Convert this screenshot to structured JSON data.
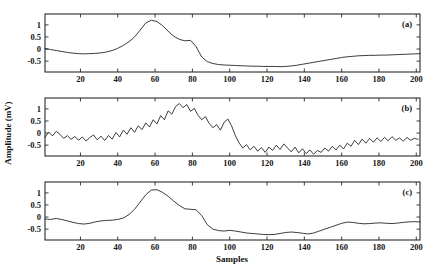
{
  "chart_data": {
    "type": "line",
    "title": "",
    "xlabel": "Samples",
    "ylabel": "Amplitude (mV)",
    "xlim": [
      1,
      202
    ],
    "ylim": [
      -0.95,
      1.45
    ],
    "xticks": [
      20,
      40,
      60,
      80,
      100,
      120,
      140,
      160,
      180,
      200
    ],
    "yticks": [
      1,
      0.5,
      0,
      -0.5
    ],
    "ytick_labels": [
      "1",
      "0.5",
      "0",
      "-0.5"
    ],
    "grid": false,
    "legend": "none",
    "panels": [
      {
        "label": "(a)",
        "name": "clean-signal",
        "x": [
          1,
          4,
          7,
          10,
          13,
          16,
          19,
          22,
          25,
          28,
          31,
          34,
          37,
          40,
          43,
          46,
          49,
          52,
          55,
          58,
          61,
          64,
          67,
          70,
          73,
          76,
          79,
          82,
          85,
          88,
          91,
          94,
          97,
          100,
          103,
          106,
          109,
          112,
          115,
          118,
          121,
          124,
          127,
          130,
          133,
          136,
          139,
          142,
          145,
          148,
          151,
          154,
          157,
          160,
          163,
          166,
          169,
          172,
          175,
          178,
          181,
          184,
          187,
          190,
          193,
          196,
          199,
          202
        ],
        "y": [
          0.02,
          -0.02,
          -0.06,
          -0.1,
          -0.14,
          -0.17,
          -0.19,
          -0.2,
          -0.19,
          -0.18,
          -0.16,
          -0.12,
          -0.06,
          0.03,
          0.15,
          0.3,
          0.5,
          0.78,
          1.08,
          1.19,
          1.14,
          0.97,
          0.74,
          0.53,
          0.4,
          0.34,
          0.36,
          0.1,
          -0.33,
          -0.52,
          -0.6,
          -0.64,
          -0.66,
          -0.67,
          -0.68,
          -0.69,
          -0.7,
          -0.71,
          -0.71,
          -0.72,
          -0.72,
          -0.72,
          -0.73,
          -0.72,
          -0.7,
          -0.67,
          -0.63,
          -0.59,
          -0.55,
          -0.51,
          -0.47,
          -0.43,
          -0.39,
          -0.35,
          -0.32,
          -0.3,
          -0.28,
          -0.27,
          -0.26,
          -0.26,
          -0.25,
          -0.25,
          -0.24,
          -0.23,
          -0.22,
          -0.21,
          -0.2,
          -0.19
        ]
      },
      {
        "label": "(b)",
        "name": "noisy-signal",
        "x": [
          1,
          3,
          5,
          7,
          9,
          11,
          13,
          15,
          17,
          19,
          21,
          23,
          25,
          27,
          29,
          31,
          33,
          35,
          37,
          39,
          41,
          43,
          45,
          47,
          49,
          51,
          53,
          55,
          57,
          59,
          61,
          63,
          65,
          67,
          69,
          71,
          73,
          75,
          77,
          79,
          81,
          83,
          85,
          87,
          89,
          91,
          93,
          95,
          97,
          99,
          101,
          103,
          105,
          107,
          109,
          111,
          113,
          115,
          117,
          119,
          121,
          123,
          125,
          127,
          129,
          131,
          133,
          135,
          137,
          139,
          141,
          143,
          145,
          147,
          149,
          151,
          153,
          155,
          157,
          159,
          161,
          163,
          165,
          167,
          169,
          171,
          173,
          175,
          177,
          179,
          181,
          183,
          185,
          187,
          189,
          191,
          193,
          195,
          197,
          199,
          201
        ],
        "y": [
          -0.18,
          0.04,
          -0.12,
          0.07,
          -0.05,
          -0.22,
          -0.11,
          -0.26,
          -0.14,
          -0.3,
          -0.16,
          -0.33,
          -0.19,
          -0.08,
          -0.28,
          -0.13,
          -0.31,
          -0.1,
          -0.25,
          0.02,
          -0.16,
          0.12,
          -0.05,
          0.22,
          0.03,
          0.3,
          0.14,
          0.42,
          0.25,
          0.55,
          0.38,
          0.72,
          0.55,
          0.92,
          0.78,
          1.1,
          1.22,
          1.05,
          1.18,
          0.9,
          1.02,
          0.74,
          0.55,
          0.68,
          0.4,
          0.22,
          0.35,
          0.12,
          0.44,
          0.58,
          0.3,
          -0.1,
          -0.4,
          -0.62,
          -0.48,
          -0.7,
          -0.55,
          -0.75,
          -0.6,
          -0.8,
          -0.58,
          -0.72,
          -0.5,
          -0.68,
          -0.45,
          -0.62,
          -0.78,
          -0.58,
          -0.82,
          -0.65,
          -0.85,
          -0.7,
          -0.88,
          -0.72,
          -0.8,
          -0.62,
          -0.75,
          -0.55,
          -0.7,
          -0.5,
          -0.66,
          -0.42,
          -0.55,
          -0.3,
          -0.48,
          -0.25,
          -0.42,
          -0.22,
          -0.38,
          -0.2,
          -0.35,
          -0.18,
          -0.32,
          -0.15,
          -0.3,
          -0.2,
          -0.34,
          -0.18,
          -0.3,
          -0.22,
          -0.26
        ]
      },
      {
        "label": "(c)",
        "name": "denoised-signal",
        "x": [
          1,
          4,
          7,
          10,
          13,
          16,
          19,
          22,
          25,
          28,
          31,
          34,
          37,
          40,
          43,
          46,
          49,
          52,
          55,
          58,
          61,
          64,
          67,
          70,
          73,
          76,
          79,
          82,
          85,
          88,
          91,
          94,
          97,
          100,
          103,
          106,
          109,
          112,
          115,
          118,
          121,
          124,
          127,
          130,
          133,
          136,
          139,
          142,
          145,
          148,
          151,
          154,
          157,
          160,
          163,
          166,
          169,
          172,
          175,
          178,
          181,
          184,
          187,
          190,
          193,
          196,
          199,
          202
        ],
        "y": [
          -0.08,
          -0.1,
          -0.06,
          -0.1,
          -0.16,
          -0.22,
          -0.27,
          -0.29,
          -0.26,
          -0.2,
          -0.16,
          -0.14,
          -0.13,
          -0.1,
          -0.04,
          0.1,
          0.32,
          0.62,
          0.92,
          1.12,
          1.13,
          1.02,
          0.86,
          0.66,
          0.48,
          0.34,
          0.32,
          0.3,
          0.06,
          -0.32,
          -0.5,
          -0.56,
          -0.58,
          -0.55,
          -0.58,
          -0.62,
          -0.66,
          -0.68,
          -0.7,
          -0.72,
          -0.73,
          -0.72,
          -0.68,
          -0.64,
          -0.62,
          -0.64,
          -0.67,
          -0.7,
          -0.66,
          -0.58,
          -0.5,
          -0.42,
          -0.34,
          -0.26,
          -0.21,
          -0.22,
          -0.26,
          -0.28,
          -0.27,
          -0.25,
          -0.24,
          -0.26,
          -0.27,
          -0.25,
          -0.22,
          -0.2,
          -0.19,
          -0.2
        ]
      }
    ]
  }
}
